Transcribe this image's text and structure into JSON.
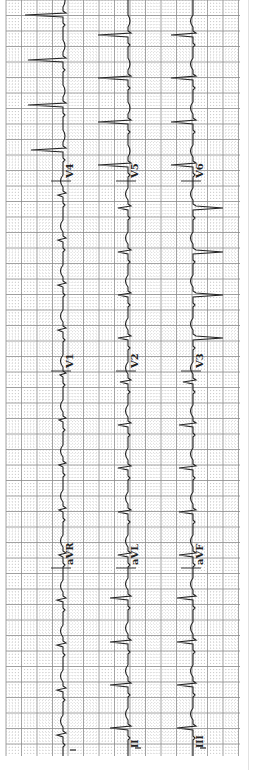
{
  "document": {
    "type": "12-lead electrocardiogram (scanned, rotated 90°)",
    "orientation": "time runs bottom-to-top",
    "paper": {
      "left": 6,
      "right": 240,
      "top": 0,
      "bottom": 756,
      "major_px": 15.5,
      "grid_color": "#8a8a8a",
      "minor_color": "#b5b5b5"
    },
    "trace_color": "#222222"
  },
  "columns": [
    {
      "baseline_x": 63,
      "rhythm_label": "I",
      "leads": [
        {
          "label": "I",
          "y_start": 756,
          "y_end": 575
        },
        {
          "label": "aVR",
          "y_start": 575,
          "y_end": 375,
          "label_y": 565
        },
        {
          "label": "V1",
          "y_start": 375,
          "y_end": 185,
          "label_y": 368
        },
        {
          "label": "V4",
          "y_start": 185,
          "y_end": 0,
          "label_y": 178
        }
      ],
      "beats_y": [
        735,
        690,
        645,
        600,
        555,
        510,
        465,
        420,
        375,
        330,
        285,
        240,
        195,
        150,
        105,
        60,
        15
      ],
      "qrs_amp": [
        -6,
        -6,
        -6,
        -6,
        -4,
        -4,
        -4,
        -4,
        -3,
        -5,
        -5,
        -5,
        -5,
        -32,
        -35,
        -35,
        -38
      ]
    },
    {
      "baseline_x": 128,
      "rhythm_label": "II",
      "leads": [
        {
          "label": "II",
          "y_start": 756,
          "y_end": 575
        },
        {
          "label": "aVL",
          "y_start": 575,
          "y_end": 375,
          "label_y": 565
        },
        {
          "label": "V2",
          "y_start": 375,
          "y_end": 185,
          "label_y": 368
        },
        {
          "label": "V5",
          "y_start": 185,
          "y_end": 0,
          "label_y": 178
        }
      ],
      "beats_y": [
        728,
        685,
        642,
        598,
        555,
        512,
        468,
        425,
        382,
        338,
        295,
        252,
        208,
        165,
        122,
        78,
        35
      ],
      "qrs_amp": [
        -18,
        -18,
        -18,
        -18,
        -10,
        -10,
        -10,
        -10,
        -8,
        -10,
        -10,
        -10,
        -10,
        -30,
        -30,
        -30,
        -30
      ]
    },
    {
      "baseline_x": 193,
      "rhythm_label": "III",
      "leads": [
        {
          "label": "III",
          "y_start": 756,
          "y_end": 575
        },
        {
          "label": "aVF",
          "y_start": 575,
          "y_end": 375,
          "label_y": 565
        },
        {
          "label": "V3",
          "y_start": 375,
          "y_end": 185,
          "label_y": 368
        },
        {
          "label": "V6",
          "y_start": 185,
          "y_end": 0,
          "label_y": 178
        }
      ],
      "beats_y": [
        728,
        685,
        642,
        598,
        555,
        512,
        468,
        425,
        382,
        338,
        295,
        252,
        208,
        165,
        122,
        78,
        35
      ],
      "qrs_amp": [
        -16,
        -16,
        -16,
        -16,
        -14,
        -14,
        -14,
        -14,
        -10,
        30,
        30,
        30,
        30,
        -22,
        -22,
        -22,
        -22
      ]
    }
  ],
  "calibration": [
    {
      "x": 73,
      "y": 750,
      "label": ""
    },
    {
      "x": 138,
      "y": 748,
      "label": "II"
    },
    {
      "x": 203,
      "y": 748,
      "label": "III"
    }
  ]
}
